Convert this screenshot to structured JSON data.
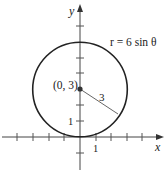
{
  "diagram": {
    "type": "polar-curve-plot",
    "equation_label": "r = 6 sin θ",
    "center_label": "(0, 3)",
    "radius_label": "3",
    "axes": {
      "x_label": "x",
      "y_label": "y",
      "x_tick_label": "1",
      "y_tick_label": "1",
      "x_ticks": [
        -4,
        -3,
        -2,
        -1,
        1,
        2,
        3,
        4
      ],
      "y_ticks": [
        -1,
        1,
        2,
        3,
        4,
        5,
        6,
        7
      ]
    },
    "circle": {
      "center": [
        0,
        3
      ],
      "radius": 3
    },
    "colors": {
      "curve": "#222222",
      "axis": "#444444",
      "radius_line": "#555555"
    }
  }
}
